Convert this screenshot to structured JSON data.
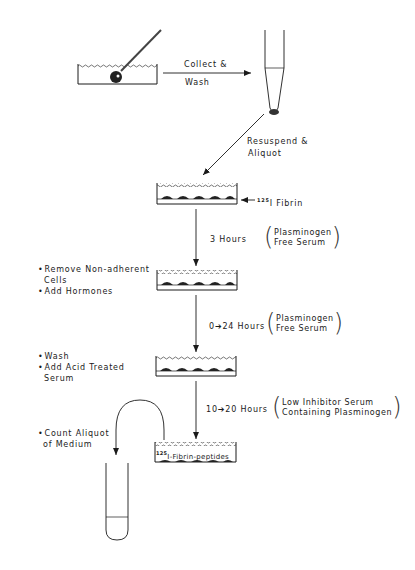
{
  "steps": {
    "collect_wash": {
      "line1": "Collect &",
      "line2": "Wash"
    },
    "resuspend": {
      "line1": "Resuspend &",
      "line2": "Aliquot"
    },
    "fibrin_label": {
      "isotope": "125",
      "text": "I Fibrin"
    },
    "step3h": {
      "time": "3 Hours",
      "cond1": "Plasminogen",
      "cond2": "Free Serum"
    },
    "remove": {
      "b1": "Remove Non-adherent",
      "b1b": "Cells",
      "b2": "Add Hormones"
    },
    "step24h": {
      "time": "0➔24 Hours",
      "cond1": "Plasminogen",
      "cond2": "Free Serum"
    },
    "wash": {
      "b1": "Wash",
      "b2": "Add Acid Treated",
      "b2b": "Serum"
    },
    "step20h": {
      "time": "10➔20 Hours",
      "cond1": "Low Inhibitor Serum",
      "cond2": "Containing Plasminogen"
    },
    "peptides": {
      "isotope": "125",
      "text": "I-Fibrin-peptides"
    },
    "count": {
      "b1": "Count Aliquot",
      "b1b": "of Medium"
    }
  },
  "colors": {
    "ink": "#1a1a1a",
    "background": "#ffffff"
  }
}
